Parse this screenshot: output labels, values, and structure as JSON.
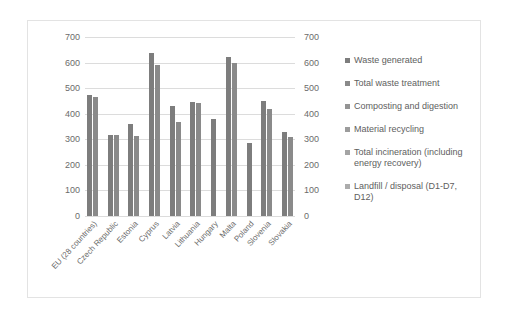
{
  "chart_data": {
    "type": "bar",
    "title": "",
    "xlabel": "",
    "ylabel": "",
    "ylim": [
      0,
      700
    ],
    "grid": true,
    "legend_position": "right",
    "dual_axis": true,
    "yticks": [
      700,
      600,
      500,
      400,
      300,
      200,
      100,
      0
    ],
    "yticks_right": [
      700,
      600,
      500,
      400,
      300,
      200,
      100,
      0
    ],
    "categories": [
      "EU (28 countries)",
      "Czech Republic",
      "Estonia",
      "Cyprus",
      "Latvia",
      "Lithuania",
      "Hungary",
      "Malta",
      "Poland",
      "Slovenia",
      "Slovakia"
    ],
    "series": [
      {
        "name": "Waste generated",
        "color": "#7d7d7d",
        "values": [
          475,
          318,
          360,
          638,
          432,
          445,
          378,
          620,
          286,
          448,
          328
        ]
      },
      {
        "name": "Total waste treatment",
        "color": "#8a8a8a",
        "values": [
          465,
          318,
          312,
          590,
          367,
          443,
          0,
          600,
          0,
          420,
          310
        ]
      },
      {
        "name": "Composting and digestion",
        "color": "#949494",
        "values": [
          0,
          0,
          0,
          0,
          0,
          0,
          0,
          0,
          0,
          0,
          0
        ]
      },
      {
        "name": "Material recycling",
        "color": "#9c9c9c",
        "values": [
          0,
          0,
          0,
          0,
          0,
          0,
          0,
          0,
          0,
          0,
          0
        ]
      },
      {
        "name": "Total incineration (including energy recovery)",
        "color": "#a4a4a4",
        "values": [
          0,
          0,
          0,
          0,
          0,
          0,
          0,
          0,
          0,
          0,
          0
        ]
      },
      {
        "name": "Landfill / disposal (D1-D7, D12)",
        "color": "#acacac",
        "values": [
          0,
          0,
          0,
          0,
          0,
          0,
          0,
          0,
          0,
          0,
          0
        ]
      }
    ]
  },
  "legend": {
    "items": [
      {
        "label": "Waste generated"
      },
      {
        "label": "Total waste treatment"
      },
      {
        "label": "Composting and digestion"
      },
      {
        "label": "Material recycling"
      },
      {
        "label": "Total incineration (including energy recovery)"
      },
      {
        "label": "Landfill / disposal (D1-D7, D12)"
      }
    ]
  },
  "colors": {
    "frame_border": "#e3e3e3",
    "gridline": "#dcdcdc",
    "text": "#6b6b6b",
    "bar_primary": "#7d7d7d"
  }
}
